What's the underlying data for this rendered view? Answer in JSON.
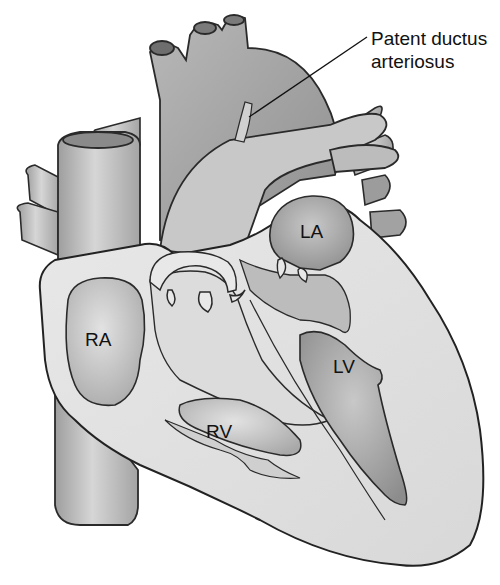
{
  "diagram": {
    "callout": {
      "line1": "Patent ductus",
      "line2": "arteriosus"
    },
    "chambers": [
      {
        "id": "ra",
        "label": "RA"
      },
      {
        "id": "la",
        "label": "LA"
      },
      {
        "id": "lv",
        "label": "LV"
      },
      {
        "id": "rv",
        "label": "RV"
      }
    ],
    "colors": {
      "background": "#ffffff",
      "outline": "#2a2a2a",
      "wall": "#e4e4e4",
      "chamber": "#c6c6c6",
      "vessel": "#b3b3b3",
      "text": "#111111"
    }
  }
}
